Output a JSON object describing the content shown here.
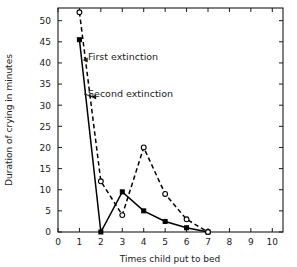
{
  "chart_data": {
    "type": "line",
    "title": "",
    "subtitle": "",
    "xlabel": "Times child put to bed",
    "ylabel": "Duration of crying in minutes",
    "xlim": [
      0,
      10.5
    ],
    "ylim": [
      0,
      53
    ],
    "grid": false,
    "legend_position": "inline-annotation",
    "x_tick_labels": [
      "0",
      "1",
      "2",
      "3",
      "4",
      "5",
      "6",
      "7",
      "8",
      "9",
      "10"
    ],
    "x_ticks": [
      0,
      1,
      2,
      3,
      4,
      5,
      6,
      7,
      8,
      9,
      10
    ],
    "y_tick_labels": [
      "0",
      "5",
      "10",
      "15",
      "20",
      "25",
      "30",
      "35",
      "40",
      "45",
      "50"
    ],
    "y_ticks": [
      0,
      5,
      10,
      15,
      20,
      25,
      30,
      35,
      40,
      45,
      50
    ],
    "x": [
      1,
      2,
      3,
      4,
      5,
      6,
      7
    ],
    "series": [
      {
        "name": "First extinction",
        "style": "solid",
        "marker": "filled-square",
        "color": "#000000",
        "values": [
          45.5,
          0,
          9.5,
          5,
          2.5,
          1,
          0
        ]
      },
      {
        "name": "Second extinction",
        "style": "dashed",
        "marker": "open-circle",
        "color": "#000000",
        "values": [
          52,
          12,
          4,
          20,
          9,
          3,
          0
        ]
      }
    ],
    "annotations": [
      {
        "text": "First extinction",
        "target_series": "First extinction",
        "text_x": 88,
        "text_y": 60
      },
      {
        "text": "Second extinction",
        "target_series": "Second extinction",
        "text_x": 88,
        "text_y": 97
      }
    ]
  }
}
